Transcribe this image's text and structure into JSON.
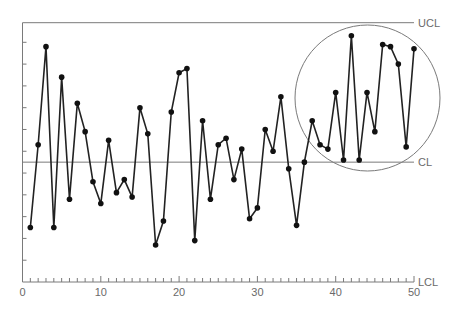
{
  "chart_data": {
    "type": "line",
    "title": "",
    "xlabel": "",
    "ylabel": "",
    "subtype": "control-chart",
    "x": [
      1,
      2,
      3,
      4,
      5,
      6,
      7,
      8,
      9,
      10,
      11,
      12,
      13,
      14,
      15,
      16,
      17,
      18,
      19,
      20,
      21,
      22,
      23,
      24,
      25,
      26,
      27,
      28,
      29,
      30,
      31,
      32,
      33,
      34,
      35,
      36,
      37,
      38,
      39,
      40,
      41,
      42,
      43,
      44,
      45,
      46,
      47,
      48,
      49,
      50
    ],
    "series": [
      {
        "name": "Process measurement",
        "values": [
          2.5,
          6.3,
          10.8,
          2.5,
          9.4,
          3.8,
          8.2,
          6.9,
          4.6,
          3.6,
          6.5,
          4.1,
          4.7,
          3.9,
          8.0,
          6.8,
          1.7,
          2.8,
          7.8,
          9.6,
          9.8,
          1.9,
          7.4,
          3.8,
          6.3,
          6.6,
          4.7,
          6.1,
          2.9,
          3.4,
          7.0,
          6.0,
          8.5,
          5.2,
          2.6,
          5.5,
          7.4,
          6.3,
          6.1,
          8.7,
          5.6,
          11.3,
          5.6,
          8.7,
          6.9,
          10.9,
          10.8,
          10.0,
          6.2,
          10.7
        ]
      }
    ],
    "control_limits": {
      "UCL": 11.9,
      "CL": 5.5,
      "LCL": 0
    },
    "xlim": [
      0,
      50
    ],
    "ylim": [
      0,
      11.9
    ],
    "x_ticks": [
      0,
      10,
      20,
      30,
      40,
      50
    ],
    "x_minor_tick_step": 1,
    "y_tick_step": 1,
    "y_tick_labels_shown": false,
    "grid": false,
    "legend": null,
    "annotations": [
      {
        "type": "circle",
        "description": "Circled region highlighting points 37–50 trending toward UCL",
        "x_range": [
          36.8,
          55.3
        ]
      }
    ],
    "labels": {
      "ucl": "UCL",
      "cl": "CL",
      "lcl": "LCL"
    },
    "colors": {
      "line": "#222222",
      "marker": "#111111",
      "limit_lines": "#7a7a7a",
      "axis": "#7a7a7a",
      "circle": "#7a7a7a",
      "text": "#6a6a6a"
    }
  }
}
